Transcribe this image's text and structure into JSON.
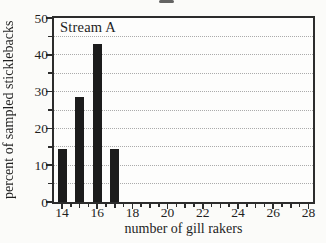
{
  "chart_data": {
    "type": "bar",
    "panel_label": "Stream A",
    "categories": [
      14,
      15,
      16,
      17
    ],
    "values": [
      14.3,
      28.6,
      42.9,
      14.3
    ],
    "title": "",
    "xlabel": "number of gill rakers",
    "ylabel": "percent of sampled sticklebacks",
    "xlim": [
      13.55,
      28.3
    ],
    "ylim": [
      0,
      50
    ],
    "x_tick_labels": [
      "14",
      "16",
      "18",
      "20",
      "22",
      "24",
      "26",
      "28"
    ],
    "x_tick_values": [
      14,
      16,
      18,
      20,
      22,
      24,
      26,
      28
    ],
    "x_minor_tick_step": 0.5,
    "y_tick_labels": [
      "0",
      "10",
      "20",
      "30",
      "40",
      "50"
    ],
    "y_tick_values": [
      0,
      10,
      20,
      30,
      40,
      50
    ],
    "y_gridline_step": 5,
    "grid": "horizontal-dotted",
    "legend": "none",
    "bar_width_units": 0.5,
    "colors": {
      "bar": "#1c1c1c",
      "frame": "#2c2c2c",
      "grid": "#ababab",
      "text": "#1f1f1f",
      "background": "#fbfbf9"
    }
  }
}
